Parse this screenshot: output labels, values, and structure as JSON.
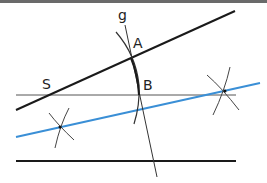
{
  "diagram": {
    "type": "geometric-construction",
    "labels": {
      "g": "g",
      "A": "A",
      "B": "B",
      "S": "S"
    },
    "colors": {
      "black_line": "#1a1a1a",
      "gray_line": "#555555",
      "blue_line": "#3a8fd6",
      "arc": "#333333",
      "topbar": "#6a6a6a"
    },
    "elements": [
      {
        "id": "line-SA",
        "description": "black line through S and A"
      },
      {
        "id": "line-horizontal-upper",
        "description": "thin horizontal line through S and B"
      },
      {
        "id": "line-blue",
        "description": "blue construction line through cross marks"
      },
      {
        "id": "line-horizontal-lower",
        "description": "bottom black horizontal line"
      },
      {
        "id": "line-g",
        "description": "line g crossing through A and B"
      },
      {
        "id": "arc-AB",
        "description": "compass arc through A and B"
      },
      {
        "id": "cross-left",
        "description": "intersecting arcs marking point on blue line (left)"
      },
      {
        "id": "cross-right",
        "description": "intersecting arcs marking point on blue line (right)"
      }
    ]
  }
}
